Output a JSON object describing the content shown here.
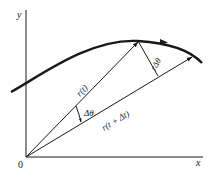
{
  "diagram": {
    "type": "vector-kinematics",
    "axes": {
      "x_label": "x",
      "y_label": "y",
      "origin_label": "0"
    },
    "vectors": [
      {
        "name": "r(t)",
        "label": "r(t)"
      },
      {
        "name": "r(t+Δt)",
        "label": "r(t + Δt)"
      }
    ],
    "annotations": {
      "angle": "Δθ",
      "arc_length": "rΔθ"
    },
    "colors": {
      "ink": "#1a1a1a",
      "background": "#ffffff"
    }
  }
}
